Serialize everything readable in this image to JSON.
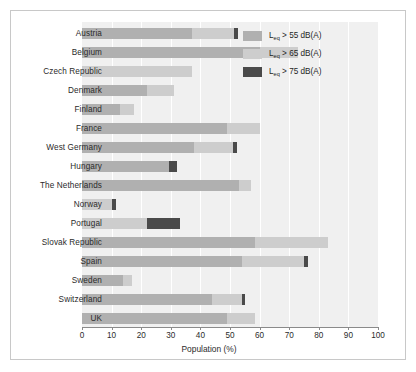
{
  "chart_data": {
    "type": "bar",
    "orientation": "horizontal",
    "stacked": true,
    "title": "",
    "xlabel": "Population (%)",
    "ylabel": "",
    "xlim": [
      0,
      100
    ],
    "xticks": [
      0,
      10,
      20,
      30,
      40,
      50,
      60,
      70,
      80,
      90,
      100
    ],
    "grid": "vertical-white-gridlines",
    "legend_position": "top-right",
    "categories": [
      "Austria",
      "Belgium",
      "Czech Republic",
      "Denmark",
      "Finland",
      "France",
      "West Germany",
      "Hungary",
      "The Netherlands",
      "Norway",
      "Portugal",
      "Slovak Republic",
      "Spain",
      "Sweden",
      "Switzerland",
      "UK"
    ],
    "series": [
      {
        "name": "Leq > 55 dB(A)",
        "color": "#b0b0b0",
        "values": [
          37,
          60,
          0,
          22,
          13,
          49,
          38,
          29.5,
          53,
          0,
          0,
          58.5,
          54,
          14,
          44,
          49
        ]
      },
      {
        "name": "Leq > 65 dB(A)",
        "color": "#cdcdcd",
        "values": [
          14.5,
          13,
          37,
          9,
          4.5,
          11,
          13,
          0,
          4,
          10,
          22,
          24.5,
          21,
          3,
          10,
          9.5
        ]
      },
      {
        "name": "Leq > 75 dB(A)",
        "color": "#4a4a4a",
        "values": [
          1.2,
          0,
          0,
          0,
          0,
          0,
          1.2,
          2.5,
          0,
          1.5,
          11,
          0,
          1.2,
          0,
          1.2,
          0
        ]
      }
    ],
    "totals": [
      52.7,
      73,
      37,
      31,
      17.5,
      60,
      52.2,
      32,
      57,
      11.5,
      33,
      83,
      76.2,
      17,
      55.2,
      58.5
    ]
  },
  "legend": {
    "items": [
      {
        "prefix": "L",
        "sub": "eq",
        "suffix": " > 55 dB(A)",
        "color": "#b0b0b0"
      },
      {
        "prefix": "L",
        "sub": "eq",
        "suffix": " > 65 dB(A)",
        "color": "#cdcdcd"
      },
      {
        "prefix": "L",
        "sub": "eq",
        "suffix": " > 75 dB(A)",
        "color": "#4a4a4a"
      }
    ]
  },
  "axis": {
    "x_title": "Population (%)",
    "tick_labels": [
      "0",
      "10",
      "20",
      "30",
      "40",
      "50",
      "60",
      "70",
      "80",
      "90",
      "100"
    ]
  },
  "colors": {
    "plot_background": "#f0f0f0",
    "gridline": "#ffffff",
    "axis": "#8a8a8a",
    "text": "#2b2b2b",
    "frame": "#c8c8c8"
  }
}
